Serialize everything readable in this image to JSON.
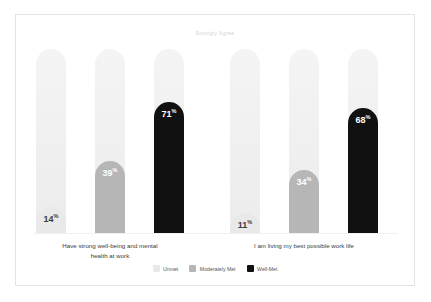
{
  "chart_data": {
    "type": "bar",
    "title": "Strongly Agree",
    "xlabel": "",
    "ylabel": "",
    "ylim": [
      0,
      100
    ],
    "grid": false,
    "legend_position": "bottom-center",
    "value_suffix": "%",
    "categories": [
      "Have strong well-being and mental health at work",
      "I am living my best possible work life"
    ],
    "series": [
      {
        "name": "Unmet",
        "color": "#e9e9e9",
        "values": [
          14,
          11
        ]
      },
      {
        "name": "Moderately Met",
        "color": "#b6b6b6",
        "values": [
          39,
          34
        ]
      },
      {
        "name": "Well-Met",
        "color": "#111111",
        "values": [
          71,
          68
        ]
      }
    ]
  },
  "chart": {
    "title": "Strongly Agree",
    "categories": [
      {
        "label_line1": "Have strong well-being and mental",
        "label_line2": "health at work"
      },
      {
        "label_line1": "I am living my best possible work life",
        "label_line2": ""
      }
    ],
    "bars": [
      {
        "value": "14",
        "suffix": "%",
        "label_color": "#3c3c3c"
      },
      {
        "value": "39",
        "suffix": "%",
        "label_color": "#ffffff"
      },
      {
        "value": "71",
        "suffix": "%",
        "label_color": "#ffffff"
      },
      {
        "value": "11",
        "suffix": "%",
        "label_color": "#3c3c3c"
      },
      {
        "value": "34",
        "suffix": "%",
        "label_color": "#ffffff"
      },
      {
        "value": "68",
        "suffix": "%",
        "label_color": "#ffffff"
      }
    ],
    "legend": [
      {
        "label": "Unmet",
        "color": "#e9e9e9"
      },
      {
        "label": "Moderately Met",
        "color": "#b6b6b6"
      },
      {
        "label": "Well-Met",
        "color": "#111111"
      }
    ]
  }
}
